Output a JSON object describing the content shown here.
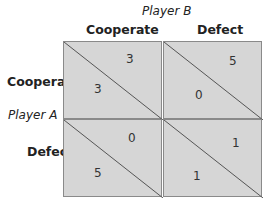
{
  "diagram": {
    "type": "payoff_matrix",
    "column_player": "Player B",
    "row_player": "Player A",
    "column_strategies": [
      "Cooperate",
      "Defect"
    ],
    "row_strategies": [
      "Cooperate",
      "Defect"
    ],
    "cells": [
      {
        "row": "Cooperate",
        "col": "Cooperate",
        "payoff_A": "3",
        "payoff_B": "3"
      },
      {
        "row": "Cooperate",
        "col": "Defect",
        "payoff_A": "0",
        "payoff_B": "5"
      },
      {
        "row": "Defect",
        "col": "Cooperate",
        "payoff_A": "5",
        "payoff_B": "0"
      },
      {
        "row": "Defect",
        "col": "Defect",
        "payoff_A": "1",
        "payoff_B": "1"
      }
    ],
    "colors": {
      "cell_fill": "#d6d6d6",
      "border": "#8a8a8a",
      "diagonal": "#555555"
    }
  }
}
